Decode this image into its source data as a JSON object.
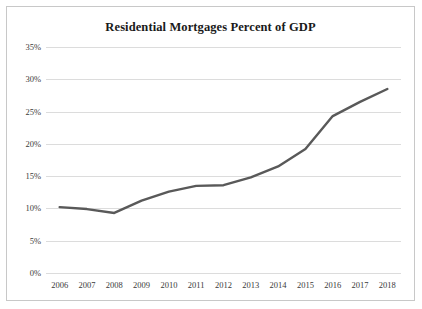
{
  "chart_data": {
    "type": "line",
    "title": "Residential Mortgages Percent of GDP",
    "xlabel": "",
    "ylabel": "",
    "categories": [
      "2006",
      "2007",
      "2008",
      "2009",
      "2010",
      "2011",
      "2012",
      "2013",
      "2014",
      "2015",
      "2016",
      "2017",
      "2018"
    ],
    "series": [
      {
        "name": "Residential Mortgages Percent of GDP",
        "values": [
          10.2,
          9.9,
          9.3,
          11.2,
          12.6,
          13.5,
          13.6,
          14.8,
          16.5,
          19.2,
          24.3,
          26.5,
          28.5
        ]
      }
    ],
    "ylim": [
      0,
      35
    ],
    "ytick_values": [
      0,
      5,
      10,
      15,
      20,
      25,
      30,
      35
    ],
    "ytick_labels": [
      "0%",
      "5%",
      "10%",
      "15%",
      "20%",
      "25%",
      "30%",
      "35%"
    ],
    "xtick_labels": [
      "2006",
      "2007",
      "2008",
      "2009",
      "2010",
      "2011",
      "2012",
      "2013",
      "2014",
      "2015",
      "2016",
      "2017",
      "2018"
    ],
    "grid": "horizontal",
    "legend": "none",
    "line_color": "#595959",
    "gridline_color": "#dcdcdc",
    "border_color": "#c8c8c8",
    "background_color": "#ffffff"
  }
}
